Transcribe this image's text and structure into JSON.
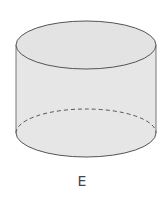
{
  "diagram": {
    "shape": "cylinder",
    "label": "E",
    "fill": "#e6e6e6",
    "stroke": "#555555",
    "hidden_edge": "dashed",
    "top_ellipse": {
      "cx": 86,
      "cy": 45,
      "rx": 70,
      "ry": 24
    },
    "bottom_ellipse": {
      "cx": 86,
      "cy": 133,
      "rx": 70,
      "ry": 24
    }
  }
}
